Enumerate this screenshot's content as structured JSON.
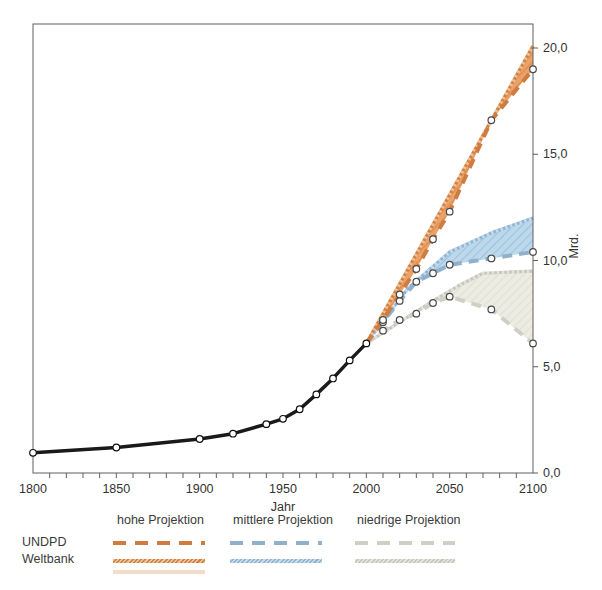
{
  "figure": {
    "xlabel": "Jahr",
    "ylabel": "Mrd."
  },
  "legend": {
    "row_labels": [
      "UNDPD",
      "Weltbank"
    ],
    "columns": [
      {
        "label": "hohe Projektion",
        "dash_color": "#ce7c40",
        "solid_color": "#d4813c"
      },
      {
        "label": "mittlere Projektion",
        "dash_color": "#90b0cc",
        "solid_color": "#8fb4d4"
      },
      {
        "label": "niedrige Projektion",
        "dash_color": "#cfcfc5",
        "solid_color": "#c6c6bc"
      }
    ]
  },
  "chart_data": {
    "type": "line",
    "title": "",
    "xlabel": "Jahr",
    "ylabel": "Mrd.",
    "x_range": [
      1800,
      2100
    ],
    "y_range": [
      0,
      20
    ],
    "x_minor_step": 10,
    "x_ticks": [
      {
        "v": 1800,
        "label": "1800"
      },
      {
        "v": 1850,
        "label": "1850"
      },
      {
        "v": 1900,
        "label": "1900"
      },
      {
        "v": 1950,
        "label": "1950"
      },
      {
        "v": 2000,
        "label": "2000"
      },
      {
        "v": 2050,
        "label": "2050"
      },
      {
        "v": 2100,
        "label": "2100"
      }
    ],
    "y_ticks": [
      {
        "v": 0,
        "label": "0,0"
      },
      {
        "v": 5,
        "label": "5,0"
      },
      {
        "v": 10,
        "label": "10,0"
      },
      {
        "v": 15,
        "label": "15,0"
      },
      {
        "v": 20,
        "label": "20,0"
      }
    ],
    "series": [
      {
        "name": "Weltbank niedrige Projektion",
        "source": "Weltbank",
        "variant": "niedrig",
        "style": "solid",
        "color": "#c6c6bc",
        "width": 3.2,
        "markers": false,
        "marker_start": 0,
        "points": [
          [
            2000,
            6.1
          ],
          [
            2020,
            7.1
          ],
          [
            2040,
            8.1
          ],
          [
            2055,
            8.8
          ],
          [
            2070,
            9.4
          ],
          [
            2100,
            9.5
          ]
        ]
      },
      {
        "name": "UNDPD niedrige Projektion",
        "source": "UNDPD",
        "variant": "niedrig",
        "style": "dashed",
        "color": "#cfcfc5",
        "width": 4,
        "markers": true,
        "marker_start": 1,
        "points": [
          [
            2000,
            6.1
          ],
          [
            2010,
            6.7
          ],
          [
            2020,
            7.2
          ],
          [
            2030,
            7.5
          ],
          [
            2040,
            8.0
          ],
          [
            2050,
            8.3
          ],
          [
            2075,
            7.7
          ],
          [
            2100,
            6.1
          ]
        ]
      },
      {
        "name": "Weltbank mittlere Projektion",
        "source": "Weltbank",
        "variant": "mittel",
        "style": "solid",
        "color": "#8fb4d4",
        "width": 3.2,
        "markers": false,
        "marker_start": 0,
        "points": [
          [
            2000,
            6.1
          ],
          [
            2025,
            8.7
          ],
          [
            2050,
            10.4
          ],
          [
            2075,
            11.3
          ],
          [
            2100,
            12.0
          ]
        ]
      },
      {
        "name": "UNDPD mittlere Projektion",
        "source": "UNDPD",
        "variant": "mittel",
        "style": "dashed",
        "color": "#90b0cc",
        "width": 4,
        "markers": true,
        "marker_start": 1,
        "points": [
          [
            2000,
            6.1
          ],
          [
            2010,
            7.1
          ],
          [
            2020,
            8.1
          ],
          [
            2030,
            9.0
          ],
          [
            2040,
            9.4
          ],
          [
            2050,
            9.8
          ],
          [
            2075,
            10.1
          ],
          [
            2100,
            10.4
          ]
        ]
      },
      {
        "name": "Weltbank hohe Projektion",
        "source": "Weltbank",
        "variant": "hoch",
        "style": "solid",
        "color": "#d4813c",
        "width": 3.2,
        "markers": false,
        "marker_start": 0,
        "points": [
          [
            2000,
            6.1
          ],
          [
            2100,
            20.1
          ]
        ]
      },
      {
        "name": "UNDPD hohe Projektion",
        "source": "UNDPD",
        "variant": "hoch",
        "style": "dashed",
        "color": "#ce7c40",
        "width": 4,
        "markers": true,
        "marker_start": 1,
        "points": [
          [
            2000,
            6.1
          ],
          [
            2010,
            7.2
          ],
          [
            2020,
            8.4
          ],
          [
            2030,
            9.6
          ],
          [
            2040,
            11.0
          ],
          [
            2050,
            12.3
          ],
          [
            2075,
            16.6
          ],
          [
            2100,
            19.0
          ]
        ]
      },
      {
        "name": "Weltbevoelkerung historisch",
        "source": "historisch",
        "variant": "",
        "style": "solid",
        "color": "#1a1a1a",
        "width": 3.5,
        "markers": true,
        "marker_start": 0,
        "points": [
          [
            1800,
            0.95
          ],
          [
            1850,
            1.2
          ],
          [
            1900,
            1.6
          ],
          [
            1920,
            1.85
          ],
          [
            1940,
            2.3
          ],
          [
            1950,
            2.55
          ],
          [
            1960,
            3.0
          ],
          [
            1970,
            3.7
          ],
          [
            1980,
            4.45
          ],
          [
            1990,
            5.3
          ],
          [
            2000,
            6.1
          ]
        ]
      }
    ],
    "bands": [
      {
        "upper": 0,
        "lower": 1,
        "fill": "#ecece3",
        "hatch": "#e0e0d4"
      },
      {
        "upper": 2,
        "lower": 3,
        "fill": "#bdd8eb",
        "hatch": "#9cc2de"
      },
      {
        "upper": 4,
        "lower": 5,
        "fill": "#eba269",
        "hatch": "#dd8a4a"
      }
    ],
    "legend_position": "bottom",
    "grid": false
  }
}
